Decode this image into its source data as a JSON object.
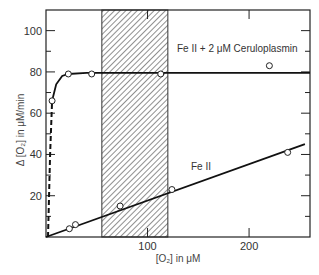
{
  "chart_data": {
    "type": "line",
    "title": "",
    "xlabel": "[O₂] in μM",
    "ylabel": "Δ [O₂] in μM/min",
    "xlim": [
      0,
      260
    ],
    "ylim": [
      0,
      110
    ],
    "x_ticks": [
      100,
      200
    ],
    "x_tick_labels": [
      "100",
      "200"
    ],
    "y_ticks": [
      20,
      40,
      60,
      80,
      100
    ],
    "y_tick_labels": [
      "20",
      "40",
      "60",
      "80",
      "100"
    ],
    "minor_y_ticks": [
      10,
      30,
      50,
      70,
      90
    ],
    "grid": false,
    "shaded_region": {
      "x_start": 55,
      "x_end": 120,
      "pattern": "diagonal-hatch"
    },
    "series": [
      {
        "name": "Fe II + 2 μM Ceruloplasmin",
        "label": "Fe II + 2 μM Ceruloplasmin",
        "points": [
          {
            "x": 6,
            "y": 66
          },
          {
            "x": 22,
            "y": 79
          },
          {
            "x": 45,
            "y": 79
          },
          {
            "x": 113,
            "y": 79
          },
          {
            "x": 220,
            "y": 83
          }
        ],
        "curve": [
          [
            2,
            0
          ],
          [
            4,
            40
          ],
          [
            6,
            66
          ],
          [
            10,
            74
          ],
          [
            16,
            78
          ],
          [
            22,
            79
          ],
          [
            40,
            79.5
          ],
          [
            260,
            79.5
          ]
        ],
        "dashed_segment_until_x": 6
      },
      {
        "name": "Fe II",
        "label": "Fe II",
        "points": [
          {
            "x": 23,
            "y": 4
          },
          {
            "x": 29,
            "y": 6
          },
          {
            "x": 73,
            "y": 15
          },
          {
            "x": 124,
            "y": 23
          },
          {
            "x": 238,
            "y": 41
          }
        ],
        "line": [
          [
            0,
            0
          ],
          [
            255,
            45
          ]
        ]
      }
    ]
  }
}
